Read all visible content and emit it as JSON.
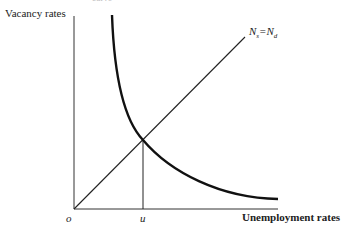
{
  "diagram": {
    "cut_title": "curve",
    "y_axis_label": "Vacancy rates",
    "x_axis_label": "Unemployment rates",
    "origin_label": "o",
    "u_label": "u",
    "line_label": {
      "N": "N",
      "s": "s",
      "eq": "=",
      "N2": "N",
      "d": "d"
    },
    "colors": {
      "axis": "#333333",
      "curve": "#111111"
    }
  }
}
